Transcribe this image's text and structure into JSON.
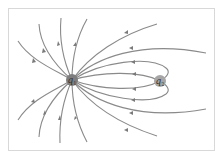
{
  "diagram": {
    "type": "electric-field-lines",
    "colors": {
      "line": "#8a8a8a",
      "charge_q1_fill": "#7d7d7d",
      "charge_q2_fill": "#a6a6a6",
      "frame_border": "#d8d8d8"
    },
    "charges": [
      {
        "id": "q1",
        "label": "q",
        "subscript": "1",
        "x": 72,
        "y": 80,
        "r": 6
      },
      {
        "id": "q2",
        "label": "q",
        "subscript": "2",
        "x": 160,
        "y": 81,
        "r": 6
      }
    ]
  }
}
